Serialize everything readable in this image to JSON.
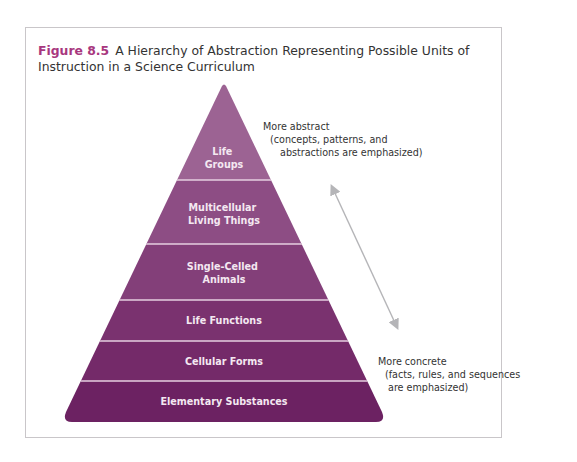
{
  "figure": {
    "number": "Figure 8.5",
    "title": "A Hierarchy of Abstraction Representing Possible Units of Instruction in a Science Curriculum"
  },
  "pyramid": {
    "levels": [
      {
        "label_lines": [
          "Life",
          "Groups"
        ],
        "color": "#9c6393"
      },
      {
        "label_lines": [
          "Multicellular",
          "Living Things"
        ],
        "color": "#8d4d84"
      },
      {
        "label_lines": [
          "Single-Celled",
          "Animals"
        ],
        "color": "#833f79"
      },
      {
        "label_lines": [
          "Life Functions"
        ],
        "color": "#7a326f"
      },
      {
        "label_lines": [
          "Cellular Forms"
        ],
        "color": "#742a69"
      },
      {
        "label_lines": [
          "Elementary Substances"
        ],
        "color": "#6c2262"
      }
    ]
  },
  "annotations": {
    "abstract": {
      "line1": "More abstract",
      "line2": "(concepts, patterns, and",
      "line3": "abstractions are emphasized)"
    },
    "concrete": {
      "line1": "More concrete",
      "line2": "(facts, rules, and sequences",
      "line3": "are emphasized)"
    }
  },
  "colors": {
    "accent": "#a8377e",
    "arrow": "#b5b5b8",
    "divider": "#e6cfe1"
  }
}
